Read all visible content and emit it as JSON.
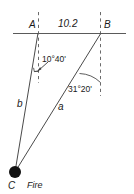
{
  "diagram": {
    "type": "triangle-geometry",
    "points": {
      "A": {
        "label": "A",
        "x": 38,
        "y": 33
      },
      "B": {
        "label": "B",
        "x": 101,
        "y": 33
      },
      "C": {
        "label": "C",
        "x": 15,
        "y": 172
      }
    },
    "baseline": {
      "name": "horizontal-baseline",
      "x1": 13,
      "x2": 126,
      "y": 33
    },
    "segments": {
      "AB": {
        "label": "10.2",
        "from": "A",
        "to": "B"
      },
      "b": {
        "label": "b",
        "from": "C",
        "to": "A"
      },
      "a": {
        "label": "a",
        "from": "C",
        "to": "B"
      }
    },
    "angles": {
      "at_A": {
        "label": "10°40'",
        "degrees": 10,
        "minutes": 40
      },
      "at_B": {
        "label": "31°20'",
        "degrees": 31,
        "minutes": 20
      }
    },
    "annotations": {
      "fire": "Fire",
      "fire_marker": "filled-dot"
    },
    "colors": {
      "stroke": "#4a4a4a",
      "text": "#1a1a1a",
      "marker": "#111111",
      "background": "#ffffff"
    }
  }
}
